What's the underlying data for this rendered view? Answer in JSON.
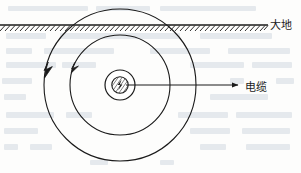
{
  "figure": {
    "title": "",
    "type": "cross-section-diagram",
    "labels": {
      "ground": "大地",
      "cable": "电缆"
    },
    "colors": {
      "stroke": "#1a1a1a",
      "background": "#fdfdfc",
      "bleed": "#cfd6e0"
    },
    "geometry": {
      "center": {
        "x": 120,
        "y": 85
      },
      "circles": [
        {
          "name": "outer-equipotential-circle",
          "r": 76
        },
        {
          "name": "middle-equipotential-circle",
          "r": 50
        },
        {
          "name": "inner-cable-circle",
          "r": 15
        },
        {
          "name": "cable-core-circle",
          "r": 8
        }
      ],
      "ground_line": {
        "x1": 0,
        "x2": 268,
        "y": 25
      },
      "hatch_count": 54,
      "cable_arrow": {
        "x1": 122,
        "x2": 240,
        "y": 85
      },
      "flow_arrows": [
        {
          "name": "outer-flow-arrow",
          "angle_deg": 196
        },
        {
          "name": "middle-flow-arrow",
          "angle_deg": 201
        }
      ]
    }
  }
}
